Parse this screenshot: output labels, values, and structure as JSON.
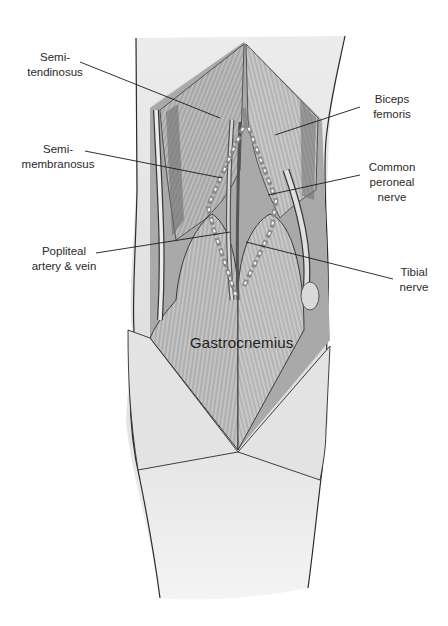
{
  "figure": {
    "colors": {
      "skin": "#e9e9e9",
      "skin_shade": "#cfcfcf",
      "muscle": "#bdbdbd",
      "muscle_dark": "#7c7c7c",
      "outline": "#2b2b2b",
      "nerve_dash": "#8a8a8a",
      "nerve_gap": "#ffffff",
      "leader": "#1a1a1a",
      "text": "#2a2a2a"
    }
  },
  "labels": {
    "semitendinosus": {
      "line1": "Semi-",
      "line2": "tendinosus"
    },
    "semimembranosus": {
      "line1": "Semi-",
      "line2": "membranosus"
    },
    "popliteal": {
      "line1": "Popliteal",
      "line2": "artery & vein"
    },
    "biceps": {
      "line1": "Biceps",
      "line2": "femoris"
    },
    "common_peroneal": {
      "line1": "Common",
      "line2": "peroneal",
      "line3": "nerve"
    },
    "tibial": {
      "line1": "Tibial",
      "line2": "nerve"
    },
    "gastrocnemius": "Gastrocnemius"
  }
}
